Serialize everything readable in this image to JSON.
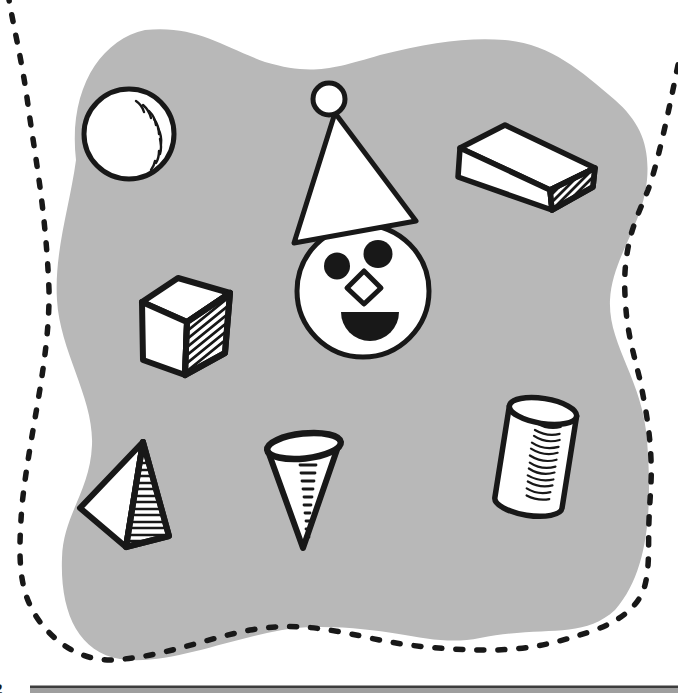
{
  "page": {
    "kind": "scanned children's workbook illustration page",
    "footer": {
      "page_number_partial": "2"
    }
  },
  "colors": {
    "paper": "#ffffff",
    "blob": "#b8b8b8",
    "ink": "#181818",
    "footer-bar": "#9e9e9e",
    "footer-bar-edge": "#3d3d3d"
  },
  "illustration": {
    "description": "Hand-drawn 3-D solid shapes scattered on a gray wavy blob inside a dashed cut-out line: a ball, a round face wearing a cone party hat with a pompom, a rectangular box, a cube, a pyramid, an upside-down cone and a cylinder. A gray footer bar and a partial page number sit at the bottom edge.",
    "items": [
      {
        "id": "sphere",
        "label": "ball / sphere"
      },
      {
        "id": "clown-face",
        "label": "round face with cone-shaped party hat"
      },
      {
        "id": "rectangular-prism",
        "label": "rectangular box"
      },
      {
        "id": "cube",
        "label": "cube"
      },
      {
        "id": "pyramid",
        "label": "pyramid"
      },
      {
        "id": "cone",
        "label": "cone (point down)"
      },
      {
        "id": "cylinder",
        "label": "cylinder"
      }
    ]
  }
}
